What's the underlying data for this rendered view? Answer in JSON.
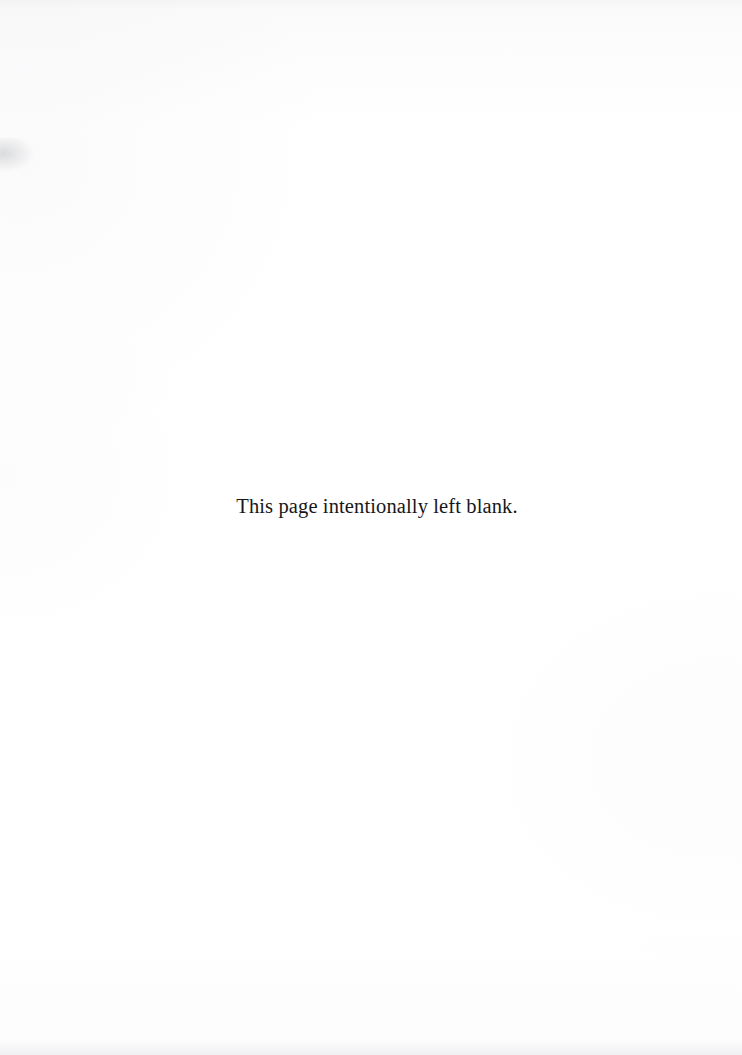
{
  "document": {
    "page_background_color": "#fefefe",
    "text_color": "#17171a",
    "notice": {
      "text": "This page intentionally left blank."
    }
  }
}
